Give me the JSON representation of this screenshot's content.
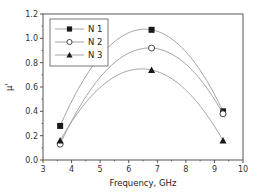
{
  "chart_data": {
    "type": "line",
    "title": "",
    "xlabel": "Frequency, GHz",
    "ylabel": "μ'",
    "xlim": [
      3,
      10
    ],
    "ylim": [
      0.0,
      1.2
    ],
    "xticks": [
      3,
      4,
      5,
      6,
      7,
      8,
      9,
      10
    ],
    "yticks": [
      0.0,
      0.2,
      0.4,
      0.6,
      0.8,
      1.0,
      1.2
    ],
    "ytick_labels": [
      "0.0",
      "0.2",
      "0.4",
      "0.6",
      "0.8",
      "1.0",
      "1.2"
    ],
    "grid": false,
    "legend_position": "upper left",
    "smooth": true,
    "series": [
      {
        "name": "N 1",
        "marker": "filled-square",
        "x": [
          3.6,
          6.8,
          9.3
        ],
        "values": [
          0.28,
          1.07,
          0.4
        ]
      },
      {
        "name": "N 2",
        "marker": "open-circle",
        "x": [
          3.6,
          6.8,
          9.3
        ],
        "values": [
          0.13,
          0.92,
          0.38
        ]
      },
      {
        "name": "N 3",
        "marker": "filled-triangle",
        "x": [
          3.6,
          6.8,
          9.3
        ],
        "values": [
          0.16,
          0.74,
          0.16
        ]
      }
    ]
  },
  "colors": {
    "line": "#9a9a9a",
    "marker": "#1a1a1a",
    "axis": "#555555"
  }
}
